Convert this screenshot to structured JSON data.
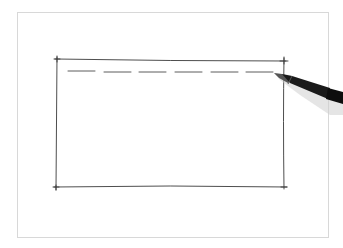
{
  "scene": {
    "description": "Hand-drawn rectangle sketch with a dashed line near the top, pen drawing the dashes",
    "colors": {
      "background": "#ffffff",
      "frame_border": "#d8d8d8",
      "ink": "#3a3a3a",
      "pen_body": "#111111"
    }
  }
}
